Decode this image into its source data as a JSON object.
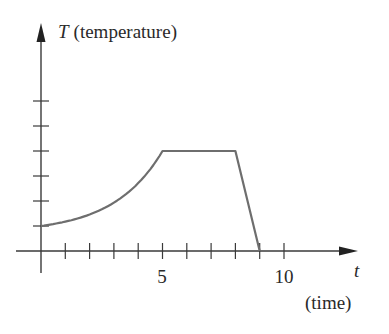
{
  "chart_data": {
    "type": "line",
    "title": "",
    "ylabel_var": "T",
    "ylabel_desc": "(temperature)",
    "xlabel_var": "t",
    "xlabel_desc": "(time)",
    "x_tick_labels": [
      {
        "value": 5,
        "label": "5"
      },
      {
        "value": 10,
        "label": "10"
      }
    ],
    "x_ticks": [
      1,
      2,
      3,
      4,
      5,
      6,
      7,
      8,
      9,
      10
    ],
    "y_ticks": [
      1,
      2,
      3,
      4,
      5,
      6
    ],
    "xlim": [
      -1,
      13
    ],
    "ylim": [
      -1,
      8.5
    ],
    "grid": false,
    "series": [
      {
        "name": "T(t)",
        "segments": [
          {
            "kind": "exponential-like increase",
            "x": [
              0,
              1,
              2,
              3,
              4,
              5
            ],
            "y": [
              1.0,
              1.15,
              1.45,
              1.95,
              2.75,
              4.0
            ]
          },
          {
            "kind": "constant",
            "x": [
              5,
              8
            ],
            "y": [
              4.0,
              4.0
            ]
          },
          {
            "kind": "linear decrease",
            "x": [
              8,
              9
            ],
            "y": [
              4.0,
              0.0
            ]
          }
        ]
      }
    ],
    "colors": {
      "axis": "#3a3a3a",
      "curve": "#6e6e6e"
    }
  }
}
